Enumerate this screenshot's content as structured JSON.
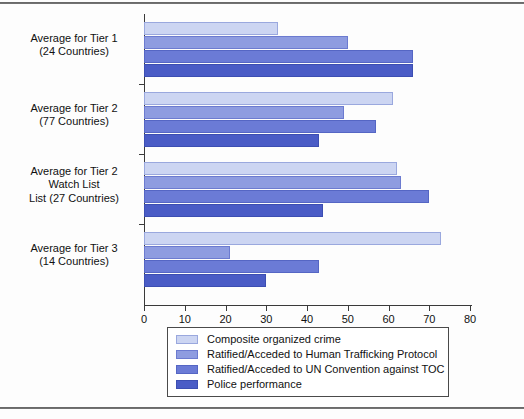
{
  "chart_data": {
    "type": "bar",
    "orientation": "horizontal",
    "title": "",
    "xlabel": "",
    "ylabel": "",
    "xlim": [
      0,
      80
    ],
    "xticks": [
      0,
      10,
      20,
      30,
      40,
      50,
      60,
      70,
      80
    ],
    "grid": false,
    "legend_position": "bottom",
    "categories": [
      "Average for Tier 1\n(24 Countries)",
      "Average for Tier 2\n(77 Countries)",
      "Average for Tier 2\nWatch List\nList (27 Countries)",
      "Average for Tier 3\n(14 Countries)"
    ],
    "category_lines": [
      [
        "Average for Tier 1",
        "(24 Countries)"
      ],
      [
        "Average for Tier 2",
        "(77 Countries)"
      ],
      [
        "Average for Tier 2",
        "Watch List",
        "List (27 Countries)"
      ],
      [
        "Average for Tier 3",
        "(14 Countries)"
      ]
    ],
    "series": [
      {
        "name": "Composite organized crime",
        "color": "#ccd5f2",
        "values": [
          33,
          61,
          62,
          73
        ]
      },
      {
        "name": "Ratified/Acceded to Human Trafficking Protocol",
        "color": "#8e9ce0",
        "values": [
          50,
          49,
          63,
          21
        ]
      },
      {
        "name": "Ratified/Acceded to UN Convention against TOC",
        "color": "#6b7bd6",
        "values": [
          66,
          57,
          70,
          43
        ]
      },
      {
        "name": "Police performance",
        "color": "#4a5cc6",
        "values": [
          66,
          43,
          44,
          30
        ]
      }
    ]
  }
}
